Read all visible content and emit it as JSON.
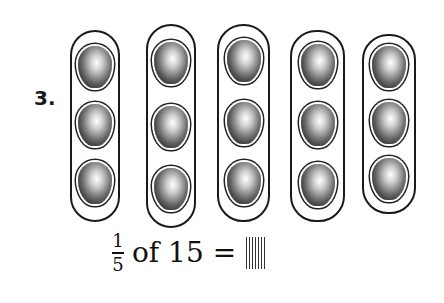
{
  "problem": {
    "number": "3.",
    "groups": [
      {
        "id": 1,
        "items": 3
      },
      {
        "id": 2,
        "items": 3
      },
      {
        "id": 3,
        "items": 3
      },
      {
        "id": 4,
        "items": 3
      },
      {
        "id": 5,
        "items": 3
      }
    ],
    "equation": {
      "numerator": "1",
      "denominator": "5",
      "text": "of 15 =",
      "answer": ""
    }
  }
}
